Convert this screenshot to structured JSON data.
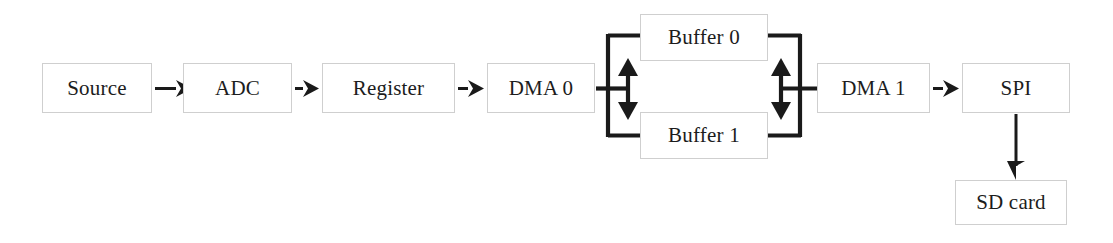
{
  "diagram": {
    "type": "block-flow-diagram",
    "colors": {
      "box_border": "#cfcfcf",
      "box_fill": "#ffffff",
      "line": "#1a1a1a",
      "text": "#1c1c1c",
      "background": "#ffffff"
    },
    "nodes": [
      {
        "id": "source",
        "label": "Source",
        "x": 42,
        "y": 63,
        "w": 110,
        "h": 50
      },
      {
        "id": "adc",
        "label": "ADC",
        "x": 183,
        "y": 63,
        "w": 109,
        "h": 50
      },
      {
        "id": "register",
        "label": "Register",
        "x": 322,
        "y": 63,
        "w": 133,
        "h": 50
      },
      {
        "id": "dma0",
        "label": "DMA 0",
        "x": 487,
        "y": 63,
        "w": 108,
        "h": 50
      },
      {
        "id": "buffer0",
        "label": "Buffer 0",
        "x": 640,
        "y": 14,
        "w": 128,
        "h": 47
      },
      {
        "id": "buffer1",
        "label": "Buffer 1",
        "x": 640,
        "y": 112,
        "w": 128,
        "h": 47
      },
      {
        "id": "dma1",
        "label": "DMA 1",
        "x": 817,
        "y": 63,
        "w": 113,
        "h": 50
      },
      {
        "id": "spi",
        "label": "SPI",
        "x": 962,
        "y": 63,
        "w": 108,
        "h": 50
      },
      {
        "id": "sdcard",
        "label": "SD card",
        "x": 955,
        "y": 180,
        "w": 112,
        "h": 45
      }
    ],
    "connections": [
      {
        "id": "source-to-adc",
        "from": "source",
        "to": "adc",
        "kind": "arrow-right"
      },
      {
        "id": "adc-to-register",
        "from": "adc",
        "to": "register",
        "kind": "arrow-right"
      },
      {
        "id": "register-to-dma0",
        "from": "register",
        "to": "dma0",
        "kind": "arrow-right"
      },
      {
        "id": "dma0-to-buffers",
        "from": "dma0",
        "to": "buffers",
        "kind": "bidirectional-bus"
      },
      {
        "id": "buffers-to-dma1",
        "from": "buffers",
        "to": "dma1",
        "kind": "bidirectional-bus"
      },
      {
        "id": "dma1-to-spi",
        "from": "dma1",
        "to": "spi",
        "kind": "arrow-right"
      },
      {
        "id": "spi-to-sdcard",
        "from": "spi",
        "to": "sdcard",
        "kind": "arrow-down"
      }
    ]
  }
}
